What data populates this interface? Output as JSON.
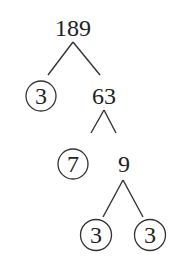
{
  "diagram": {
    "type": "factor-tree",
    "root": "189",
    "nodes": [
      {
        "id": "n189",
        "label": "189",
        "circled": false,
        "x": 73,
        "y": 28
      },
      {
        "id": "n3a",
        "label": "3",
        "circled": true,
        "x": 41,
        "y": 96
      },
      {
        "id": "n63",
        "label": "63",
        "circled": false,
        "x": 104,
        "y": 96
      },
      {
        "id": "n7",
        "label": "7",
        "circled": true,
        "x": 73,
        "y": 164
      },
      {
        "id": "n9",
        "label": "9",
        "circled": false,
        "x": 124,
        "y": 164
      },
      {
        "id": "n3b",
        "label": "3",
        "circled": true,
        "x": 96,
        "y": 235
      },
      {
        "id": "n3c",
        "label": "3",
        "circled": true,
        "x": 150,
        "y": 235
      }
    ],
    "edges": [
      {
        "from": "189",
        "to": "3"
      },
      {
        "from": "189",
        "to": "63"
      },
      {
        "from": "63",
        "to": "7"
      },
      {
        "from": "63",
        "to": "9"
      },
      {
        "from": "9",
        "to": "3"
      },
      {
        "from": "9",
        "to": "3"
      }
    ],
    "prime_factors": [
      "3",
      "7",
      "3",
      "3"
    ]
  }
}
